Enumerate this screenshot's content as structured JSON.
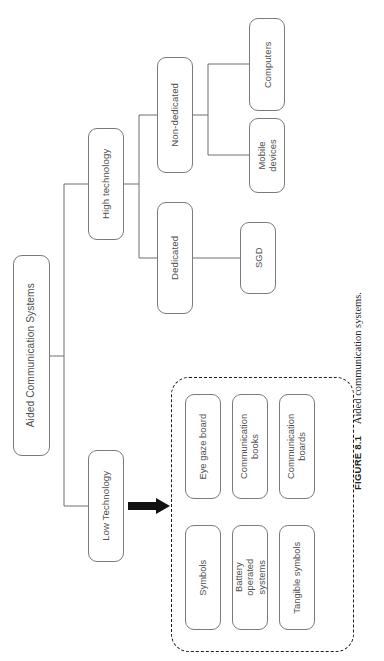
{
  "figure": {
    "number_label": "FIGURE 8.1",
    "caption_text": "Aided communication systems."
  },
  "diagram": {
    "orientation": "rotated-90-ccw",
    "root": {
      "id": "aided-communication-systems",
      "label": "Aided Communication Systems"
    },
    "level2": [
      {
        "id": "high-technology",
        "label": "High technology"
      },
      {
        "id": "low-technology",
        "label": "Low Technology"
      }
    ],
    "level3": [
      {
        "id": "non-dedicated",
        "label": "Non-dedicated"
      },
      {
        "id": "dedicated",
        "label": "Dedicated"
      }
    ],
    "level4": [
      {
        "id": "computers",
        "label": "Computers"
      },
      {
        "id": "mobile-devices",
        "label": "Mobile devices"
      },
      {
        "id": "sgd",
        "label": "SGD"
      }
    ],
    "low_tech_group": {
      "border_style": "dashed",
      "items": [
        {
          "id": "symbols",
          "label": "Symbols"
        },
        {
          "id": "battery-operated-systems",
          "label": "Battery operated systems"
        },
        {
          "id": "tangible-symbols",
          "label": "Tangible symbols"
        },
        {
          "id": "eye-gaze-board",
          "label": "Eye gaze board"
        },
        {
          "id": "communication-books",
          "label": "Communication books"
        },
        {
          "id": "communication-boards",
          "label": "Communication boards"
        }
      ]
    },
    "colors": {
      "node_border": "#7b7b7b",
      "node_text": "#4f4f4f",
      "connector": "#6f6f6f",
      "group_border": "#1d1d1d",
      "arrow": "#111111",
      "background": "#ffffff"
    }
  }
}
